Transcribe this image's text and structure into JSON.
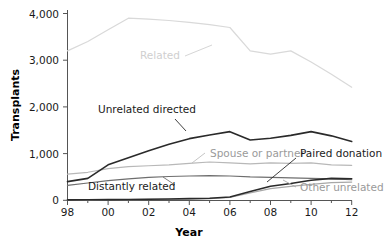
{
  "chart_data": {
    "type": "line",
    "title": "",
    "xlabel": "Year",
    "ylabel": "Transplants",
    "x": [
      1998,
      1999,
      2000,
      2001,
      2002,
      2003,
      2004,
      2005,
      2006,
      2007,
      2008,
      2009,
      2010,
      2011,
      2012
    ],
    "xtick_labels": [
      "98",
      "00",
      "02",
      "04",
      "06",
      "08",
      "10",
      "12"
    ],
    "xtick_values": [
      1998,
      2000,
      2002,
      2004,
      2006,
      2008,
      2010,
      2012
    ],
    "xlim": [
      1998,
      2012
    ],
    "ytick_labels": [
      "0",
      "1,000",
      "2,000",
      "3,000",
      "4,000"
    ],
    "ytick_values": [
      0,
      1000,
      2000,
      3000,
      4000
    ],
    "ylim": [
      0,
      4000
    ],
    "grid": false,
    "legend_position": "inline-annotations",
    "series": [
      {
        "name": "Related",
        "color": "#d9d9d9",
        "label_color": "#cfcfcf",
        "values": [
          3200,
          3400,
          3650,
          3900,
          3880,
          3850,
          3810,
          3760,
          3700,
          3200,
          3130,
          3200,
          2960,
          2700,
          2420
        ]
      },
      {
        "name": "Unrelated directed",
        "color": "#2a2a2a",
        "label_color": "#1a1a1a",
        "values": [
          400,
          470,
          760,
          910,
          1060,
          1200,
          1320,
          1400,
          1470,
          1290,
          1330,
          1390,
          1470,
          1380,
          1260
        ]
      },
      {
        "name": "Spouse or partner",
        "color": "#b8b8b8",
        "label_color": "#9a9a9a",
        "values": [
          560,
          600,
          680,
          720,
          740,
          760,
          790,
          820,
          800,
          780,
          800,
          790,
          800,
          760,
          750
        ]
      },
      {
        "name": "Distantly related",
        "color": "#6e6e6e",
        "label_color": "#555555",
        "values": [
          320,
          370,
          420,
          460,
          490,
          510,
          520,
          530,
          520,
          500,
          490,
          480,
          470,
          460,
          440
        ]
      },
      {
        "name": "Paired donation",
        "color": "#2a2a2a",
        "label_color": "#1a1a1a",
        "values": [
          10,
          12,
          15,
          18,
          22,
          28,
          35,
          45,
          70,
          190,
          300,
          360,
          430,
          470,
          460
        ]
      },
      {
        "name": "Other unrelated",
        "color": "#a8a8a8",
        "label_color": "#9a9a9a",
        "values": [
          8,
          10,
          12,
          14,
          18,
          22,
          28,
          35,
          60,
          160,
          250,
          300,
          340,
          380,
          390
        ]
      }
    ],
    "annotations": [
      {
        "name": "Related",
        "text": "Related",
        "x_px": 160,
        "y_px": 59
      },
      {
        "name": "Unrelated directed",
        "text": "Unrelated directed",
        "x_px": 98,
        "y_px": 113
      },
      {
        "name": "Spouse or partner",
        "text": "Spouse or partner",
        "x_px": 207,
        "y_px": 156
      },
      {
        "name": "Paired donation",
        "text": "Paired donation",
        "x_px": 305,
        "y_px": 156
      },
      {
        "name": "Distantly related",
        "text": "Distantly related",
        "x_px": 90,
        "y_px": 189
      },
      {
        "name": "Other unrelated",
        "text": "Other unrelated",
        "x_px": 300,
        "y_px": 190
      }
    ]
  },
  "axes": {
    "y_title": "Transplants",
    "x_title": "Year",
    "y_ticks": [
      "4,000",
      "3,000",
      "2,000",
      "1,000",
      "0"
    ],
    "x_ticks": [
      "98",
      "00",
      "02",
      "04",
      "06",
      "08",
      "10",
      "12"
    ]
  },
  "labels": {
    "related": "Related",
    "unrelated_directed": "Unrelated directed",
    "spouse_or_partner": "Spouse or partner",
    "paired_donation": "Paired donation",
    "distantly_related": "Distantly related",
    "other_unrelated": "Other unrelated"
  }
}
